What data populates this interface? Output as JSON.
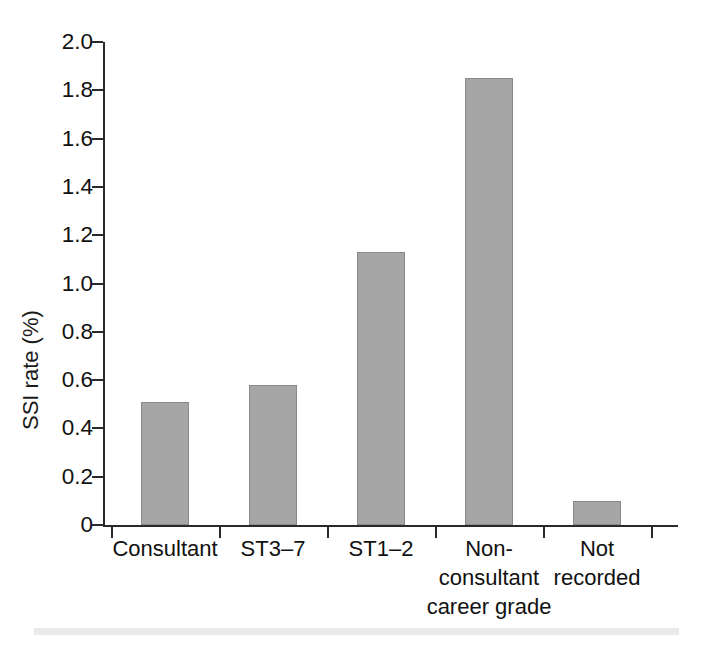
{
  "chart_data": {
    "type": "bar",
    "title": "",
    "subtitle": "",
    "xlabel": "",
    "ylabel": "SSI rate (%)",
    "categories": [
      "Consultant",
      "ST3–7",
      "ST1–2",
      "Non-consultant career grade",
      "Not recorded"
    ],
    "category_lines": [
      [
        "Consultant"
      ],
      [
        "ST3–7"
      ],
      [
        "ST1–2"
      ],
      [
        "Non-",
        "consultant",
        "career grade"
      ],
      [
        "Not",
        "recorded"
      ]
    ],
    "values": [
      0.51,
      0.58,
      1.13,
      1.85,
      0.1
    ],
    "ylim": [
      0,
      2.0
    ],
    "ytick_values": [
      0,
      0.2,
      0.4,
      0.6,
      0.8,
      1.0,
      1.2,
      1.4,
      1.6,
      1.8,
      2.0
    ],
    "ytick_labels": [
      "0",
      "0.2",
      "0.4",
      "0.6",
      "0.8",
      "1.0",
      "1.2",
      "1.4",
      "1.6",
      "1.8",
      "2.0"
    ],
    "grid": false,
    "legend": null,
    "legend_position": "none",
    "bar_color": "#a6a6a6",
    "bar_edge_color": "#8a8a8a",
    "axis_color": "#2a2a2a",
    "background_color": "#ffffff",
    "annotations": []
  },
  "figure": {
    "background_color": "#ffffff",
    "bottom_rule_color": "#e9eaec"
  }
}
